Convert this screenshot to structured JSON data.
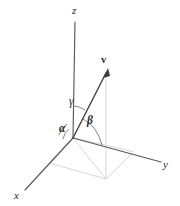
{
  "figure": {
    "kind": "3d-coordinate-axes-diagram",
    "background_color": "#ffffff",
    "axis_color": "#58595b",
    "vector_color": "#3b3c3e",
    "construction_color": "#d6d7d8",
    "arc_color": "#6e6f71",
    "label_color": "#2a2a2c"
  },
  "axes": {
    "z": {
      "label": "z",
      "origin": [
        73,
        138
      ],
      "end": [
        75,
        22
      ],
      "label_pos": [
        72,
        5
      ]
    },
    "x": {
      "label": "x",
      "origin": [
        73,
        138
      ],
      "end": [
        25,
        190
      ],
      "label_pos": [
        14,
        190
      ]
    },
    "y": {
      "label": "y",
      "origin": [
        73,
        138
      ],
      "end": [
        161,
        162
      ],
      "label_pos": [
        163,
        159
      ]
    }
  },
  "vector": {
    "label": "v",
    "bold": true,
    "tail": [
      73,
      138
    ],
    "tip": [
      108,
      70
    ],
    "label_pos": [
      101,
      55
    ]
  },
  "angles": [
    {
      "name": "alpha",
      "label": "α",
      "between": [
        "x-axis",
        "vector-v"
      ],
      "label_pos": [
        59,
        123
      ]
    },
    {
      "name": "beta",
      "label": "β",
      "between": [
        "y-axis",
        "vector-v"
      ],
      "label_pos": [
        87,
        116
      ]
    },
    {
      "name": "gamma",
      "label": "γ",
      "between": [
        "z-axis",
        "vector-v"
      ],
      "label_pos": [
        69,
        96
      ]
    }
  ],
  "construction": {
    "description": "light gray projection parallelogram in the xy-plane with a vertical drop line from the vector tip",
    "base_parallelogram": [
      [
        73,
        138
      ],
      [
        49,
        163
      ],
      [
        106,
        179
      ],
      [
        133,
        152
      ]
    ],
    "drop_line": [
      [
        106,
        179
      ],
      [
        106,
        72
      ]
    ]
  }
}
